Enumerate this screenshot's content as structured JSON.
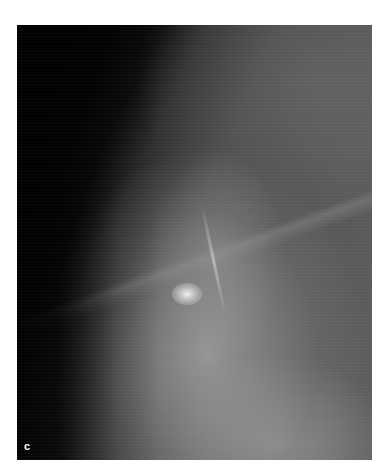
{
  "figure": {
    "panel_label": "c",
    "colors": {
      "background": "#000000",
      "tissue": "#8a8a8a",
      "bright_focus": "#f0f0f0",
      "page": "#ffffff"
    }
  }
}
